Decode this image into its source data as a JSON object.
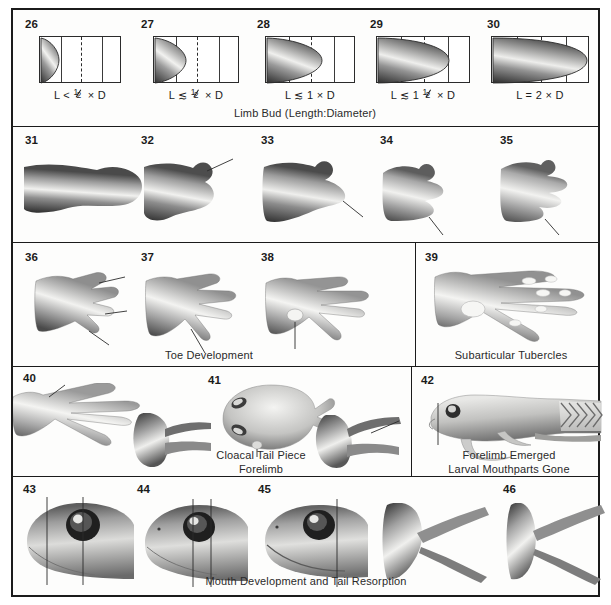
{
  "figure": {
    "stage_range": "26-46"
  },
  "rows": [
    {
      "id": "limb-bud-row",
      "caption": "Limb Bud (Length:Diameter)",
      "panels": [
        {
          "stage": "26",
          "ratio_prefix": "L <",
          "ratio_num": "1",
          "ratio_den": "2",
          "ratio_suffix": "× D",
          "bud_extent": 0.22
        },
        {
          "stage": "27",
          "ratio_prefix": "L ≲",
          "ratio_num": "1",
          "ratio_den": "2",
          "ratio_suffix": "× D",
          "bud_extent": 0.38
        },
        {
          "stage": "28",
          "ratio_prefix": "L ≲ 1",
          "ratio_num": "",
          "ratio_den": "",
          "ratio_suffix": "× D",
          "bud_extent": 0.58
        },
        {
          "stage": "29",
          "ratio_prefix": "L ≲ 1",
          "ratio_num": "1",
          "ratio_den": "2",
          "ratio_suffix": "× D",
          "bud_extent": 0.76
        },
        {
          "stage": "30",
          "ratio_prefix": "L = 2",
          "ratio_num": "",
          "ratio_den": "",
          "ratio_suffix": "× D",
          "bud_extent": 0.97
        }
      ]
    },
    {
      "id": "foot-paddle-row",
      "caption": "",
      "panels": [
        {
          "stage": "31"
        },
        {
          "stage": "32"
        },
        {
          "stage": "33"
        },
        {
          "stage": "34"
        },
        {
          "stage": "35"
        }
      ]
    },
    {
      "id": "toe-development-row",
      "caption": "Toe Development",
      "sub_caption": "Subarticular Tubercles",
      "panels": [
        {
          "stage": "36"
        },
        {
          "stage": "37"
        },
        {
          "stage": "38"
        },
        {
          "stage": "39"
        }
      ]
    },
    {
      "id": "forelimb-row",
      "caption_lines": [
        "Cloacal Tail Piece",
        "Forelimb"
      ],
      "sub_caption_lines": [
        "Forelimb Emerged",
        "Larval Mouthparts Gone"
      ],
      "panels": [
        {
          "stage": "40"
        },
        {
          "stage": "41"
        },
        {
          "stage": "42"
        }
      ]
    },
    {
      "id": "mouth-tail-row",
      "caption": "Mouth Development and Tail Resorption",
      "panels": [
        {
          "stage": "43"
        },
        {
          "stage": "44"
        },
        {
          "stage": "45"
        },
        {
          "stage": "46"
        }
      ]
    }
  ],
  "colors": {
    "frame": "#1b1b1b",
    "text": "#1b1b1b",
    "caption": "#2a2a2a",
    "background": "#ffffff",
    "art_dark": "#3d3d3d",
    "art_mid": "#8e8e8e",
    "art_light": "#e8e8e6"
  }
}
